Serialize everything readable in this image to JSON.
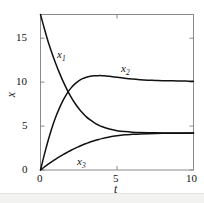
{
  "chart_data": {
    "type": "line",
    "title": "",
    "subtitle": "",
    "xlabel": "t",
    "ylabel": "x",
    "xlim": [
      0,
      10
    ],
    "ylim": [
      0,
      17.7
    ],
    "xticks": [
      0,
      5,
      10
    ],
    "xticklabels": [
      "0",
      "5",
      "10"
    ],
    "yticks": [
      0,
      5,
      10,
      15
    ],
    "yticklabels": [
      "0",
      "5",
      "10",
      "15"
    ],
    "grid": false,
    "legend": "inline-annotations",
    "frame": "box",
    "line_color": "#111111",
    "frame_color": "#8a8a8a",
    "annotations": [
      {
        "text": "x1",
        "label": "x",
        "sub": "1",
        "x": 1.25,
        "y": 12.6
      },
      {
        "text": "x2",
        "label": "x",
        "sub": "2",
        "x": 5.6,
        "y": 11.6
      },
      {
        "text": "x3",
        "label": "x",
        "sub": "3",
        "x": 3.5,
        "y": 1.5
      }
    ],
    "series": [
      {
        "name": "x1",
        "x": [
          0,
          0.25,
          0.5,
          0.75,
          1,
          1.25,
          1.5,
          1.75,
          2,
          2.25,
          2.5,
          2.75,
          3,
          3.25,
          3.5,
          3.75,
          4,
          4.5,
          5,
          5.5,
          6,
          6.5,
          7,
          7.5,
          8,
          8.5,
          9,
          9.5,
          10
        ],
        "y": [
          17.7,
          16.1,
          14.6,
          13.3,
          12.1,
          11.0,
          10.0,
          9.1,
          8.3,
          7.6,
          7.0,
          6.5,
          6.05,
          5.7,
          5.4,
          5.15,
          4.95,
          4.66,
          4.48,
          4.37,
          4.3,
          4.26,
          4.24,
          4.23,
          4.22,
          4.21,
          4.21,
          4.2,
          4.2
        ]
      },
      {
        "name": "x2",
        "x": [
          0,
          0.25,
          0.5,
          0.75,
          1,
          1.25,
          1.5,
          1.75,
          2,
          2.25,
          2.5,
          2.75,
          3,
          3.25,
          3.5,
          3.75,
          4,
          4.25,
          4.5,
          5,
          5.5,
          6,
          6.5,
          7,
          7.5,
          8,
          8.5,
          9,
          9.5,
          10
        ],
        "y": [
          0,
          1.75,
          3.35,
          4.8,
          6.05,
          7.1,
          8.0,
          8.75,
          9.35,
          9.8,
          10.15,
          10.4,
          10.56,
          10.66,
          10.72,
          10.74,
          10.74,
          10.71,
          10.67,
          10.55,
          10.44,
          10.35,
          10.28,
          10.23,
          10.2,
          10.17,
          10.15,
          10.13,
          10.12,
          10.1
        ]
      },
      {
        "name": "x3",
        "x": [
          0,
          0.25,
          0.5,
          0.75,
          1,
          1.25,
          1.5,
          1.75,
          2,
          2.25,
          2.5,
          2.75,
          3,
          3.25,
          3.5,
          3.75,
          4,
          4.5,
          5,
          5.5,
          6,
          6.5,
          7,
          7.5,
          8,
          8.5,
          9,
          9.5,
          10
        ],
        "y": [
          0,
          0.34,
          0.66,
          0.96,
          1.25,
          1.52,
          1.78,
          2.02,
          2.25,
          2.46,
          2.66,
          2.85,
          3.02,
          3.18,
          3.32,
          3.45,
          3.57,
          3.76,
          3.9,
          4.0,
          4.06,
          4.11,
          4.14,
          4.16,
          4.17,
          4.18,
          4.19,
          4.19,
          4.2
        ]
      }
    ]
  },
  "axis": {
    "ylabel": "x",
    "xlabel": "t"
  },
  "labels": {
    "x1": "x",
    "x1_sub": "1",
    "x2": "x",
    "x2_sub": "2",
    "x3": "x",
    "x3_sub": "3"
  },
  "xticklabels": {
    "t0": "0",
    "t5": "5",
    "t10": "10"
  },
  "yticklabels": {
    "v0": "0",
    "v5": "5",
    "v10": "10",
    "v15": "15"
  }
}
